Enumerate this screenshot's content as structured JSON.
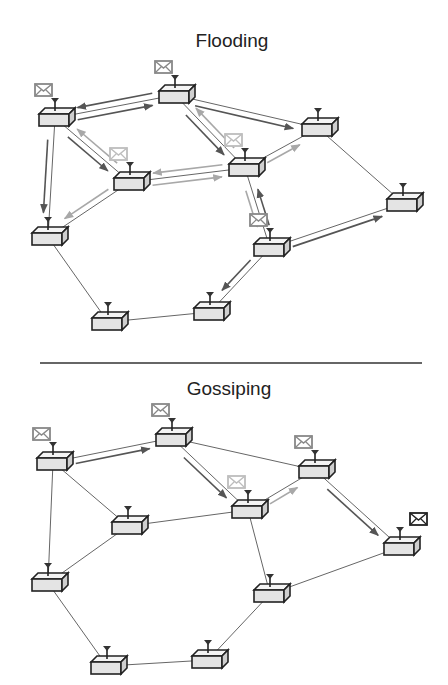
{
  "panels": [
    {
      "title": "Flooding",
      "nodes": [
        {
          "id": "A",
          "x": 55,
          "y": 118,
          "message": "dark"
        },
        {
          "id": "B",
          "x": 175,
          "y": 95,
          "message": "dark"
        },
        {
          "id": "C",
          "x": 130,
          "y": 182,
          "message": "light"
        },
        {
          "id": "D",
          "x": 245,
          "y": 168,
          "message": "light"
        },
        {
          "id": "E",
          "x": 318,
          "y": 128,
          "message": null
        },
        {
          "id": "F",
          "x": 48,
          "y": 237,
          "message": null
        },
        {
          "id": "G",
          "x": 403,
          "y": 203,
          "message": null
        },
        {
          "id": "H",
          "x": 270,
          "y": 248,
          "message": "dark"
        },
        {
          "id": "I",
          "x": 108,
          "y": 322,
          "message": null
        },
        {
          "id": "J",
          "x": 210,
          "y": 312,
          "message": null
        }
      ],
      "links": [
        [
          "A",
          "B"
        ],
        [
          "A",
          "C"
        ],
        [
          "A",
          "F"
        ],
        [
          "B",
          "D"
        ],
        [
          "B",
          "E"
        ],
        [
          "C",
          "D"
        ],
        [
          "C",
          "F"
        ],
        [
          "D",
          "E"
        ],
        [
          "D",
          "H"
        ],
        [
          "E",
          "G"
        ],
        [
          "H",
          "G"
        ],
        [
          "H",
          "J"
        ],
        [
          "F",
          "I"
        ],
        [
          "I",
          "J"
        ]
      ],
      "messages": [
        [
          "A",
          "B",
          "dark"
        ],
        [
          "B",
          "A",
          "dark"
        ],
        [
          "A",
          "C",
          "dark"
        ],
        [
          "C",
          "A",
          "light"
        ],
        [
          "A",
          "F",
          "dark"
        ],
        [
          "B",
          "D",
          "dark"
        ],
        [
          "D",
          "B",
          "light"
        ],
        [
          "B",
          "E",
          "dark"
        ],
        [
          "C",
          "D",
          "light"
        ],
        [
          "D",
          "C",
          "light"
        ],
        [
          "C",
          "F",
          "light"
        ],
        [
          "D",
          "E",
          "light"
        ],
        [
          "D",
          "H",
          "light"
        ],
        [
          "H",
          "D",
          "dark"
        ],
        [
          "H",
          "G",
          "dark"
        ],
        [
          "H",
          "J",
          "dark"
        ]
      ]
    },
    {
      "title": "Gossiping",
      "nodes": [
        {
          "id": "A",
          "x": 53,
          "y": 462,
          "message": "dark"
        },
        {
          "id": "B",
          "x": 172,
          "y": 438,
          "message": "dark"
        },
        {
          "id": "C",
          "x": 128,
          "y": 526,
          "message": null
        },
        {
          "id": "D",
          "x": 248,
          "y": 510,
          "message": "light"
        },
        {
          "id": "E",
          "x": 315,
          "y": 470,
          "message": "dark"
        },
        {
          "id": "F",
          "x": 48,
          "y": 583,
          "message": null
        },
        {
          "id": "G",
          "x": 400,
          "y": 547,
          "message": "black"
        },
        {
          "id": "H",
          "x": 270,
          "y": 594,
          "message": null
        },
        {
          "id": "I",
          "x": 107,
          "y": 666,
          "message": null
        },
        {
          "id": "J",
          "x": 208,
          "y": 660,
          "message": null
        }
      ],
      "links": [
        [
          "A",
          "B"
        ],
        [
          "A",
          "C"
        ],
        [
          "A",
          "F"
        ],
        [
          "B",
          "D"
        ],
        [
          "B",
          "E"
        ],
        [
          "C",
          "D"
        ],
        [
          "C",
          "F"
        ],
        [
          "D",
          "E"
        ],
        [
          "D",
          "H"
        ],
        [
          "E",
          "G"
        ],
        [
          "H",
          "G"
        ],
        [
          "H",
          "J"
        ],
        [
          "F",
          "I"
        ],
        [
          "I",
          "J"
        ]
      ],
      "messages": [
        [
          "A",
          "B",
          "dark"
        ],
        [
          "B",
          "D",
          "dark"
        ],
        [
          "D",
          "E",
          "light"
        ],
        [
          "E",
          "G",
          "dark"
        ]
      ]
    }
  ],
  "colors": {
    "dark": "#555555",
    "light": "#a8a8a8",
    "line": "#666666",
    "black": "#222222",
    "box": "#e4e4e4"
  }
}
